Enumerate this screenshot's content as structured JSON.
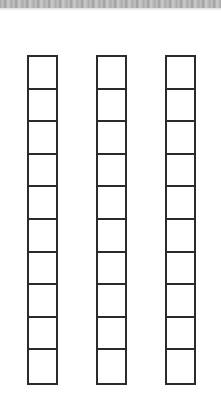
{
  "page": {
    "type": "worksheet"
  },
  "strips": [
    {
      "cells": 10,
      "left": 27
    },
    {
      "cells": 10,
      "left": 96
    },
    {
      "cells": 10,
      "left": 165
    }
  ],
  "colors": {
    "line": "#2b2b2b",
    "background": "#ffffff",
    "scan_edge": "#9a9a9a"
  }
}
